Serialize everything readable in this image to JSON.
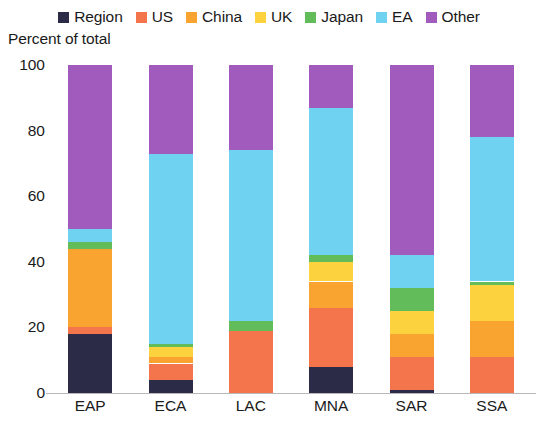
{
  "axis_title": "Percent of total",
  "legend": {
    "items": [
      {
        "label": "Region",
        "color": "#2b2b47"
      },
      {
        "label": "US",
        "color": "#f4744c"
      },
      {
        "label": "China",
        "color": "#f9a431"
      },
      {
        "label": "UK",
        "color": "#fcd23f"
      },
      {
        "label": "Japan",
        "color": "#62bc5a"
      },
      {
        "label": "EA",
        "color": "#6ed2f0"
      },
      {
        "label": "Other",
        "color": "#a05bbd"
      }
    ]
  },
  "chart_data": {
    "type": "bar",
    "subtype": "stacked-percent",
    "title": "",
    "xlabel": "",
    "ylabel": "Percent of total",
    "ylim": [
      0,
      100
    ],
    "yticks": [
      0,
      20,
      40,
      60,
      80,
      100
    ],
    "grid": false,
    "legend_position": "top-center",
    "categories": [
      "EAP",
      "ECA",
      "LAC",
      "MNA",
      "SAR",
      "SSA"
    ],
    "series": [
      {
        "name": "Region",
        "color": "#2b2b47",
        "values": [
          18,
          4,
          0,
          8,
          1,
          0
        ]
      },
      {
        "name": "US",
        "color": "#f4744c",
        "values": [
          2,
          5,
          19,
          18,
          10,
          11
        ]
      },
      {
        "name": "China",
        "color": "#f9a431",
        "values": [
          24,
          2,
          0,
          8,
          7,
          11
        ]
      },
      {
        "name": "UK",
        "color": "#fcd23f",
        "values": [
          0,
          3,
          0,
          6,
          7,
          11
        ]
      },
      {
        "name": "Japan",
        "color": "#62bc5a",
        "values": [
          2,
          1,
          3,
          2,
          7,
          1
        ]
      },
      {
        "name": "EA",
        "color": "#6ed2f0",
        "values": [
          4,
          58,
          52,
          45,
          10,
          44
        ]
      },
      {
        "name": "Other",
        "color": "#a05bbd",
        "values": [
          50,
          27,
          26,
          13,
          58,
          22
        ]
      }
    ]
  }
}
